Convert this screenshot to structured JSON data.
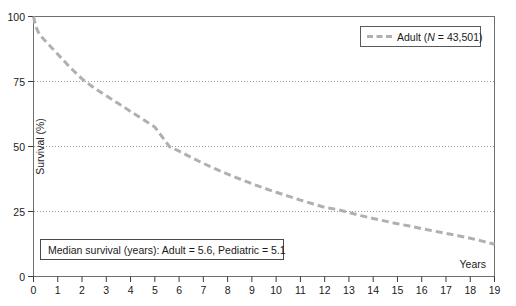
{
  "chart_data": {
    "type": "line",
    "title": "",
    "xlabel": "Years",
    "ylabel": "Survival (%)",
    "xlim": [
      0,
      19
    ],
    "ylim": [
      0,
      100
    ],
    "x_ticks": [
      0,
      1,
      2,
      3,
      4,
      5,
      6,
      7,
      8,
      9,
      10,
      11,
      12,
      13,
      14,
      15,
      16,
      17,
      18,
      19
    ],
    "y_ticks": [
      0,
      25,
      50,
      75,
      100
    ],
    "grid": "horizontal-dotted-at-25-50-75",
    "legend_position": "top-right",
    "series": [
      {
        "name": "Adult (N = 43,501)",
        "color": "#b0b0b0",
        "style": "dashed",
        "x": [
          0,
          0.1,
          0.25,
          0.5,
          0.75,
          1,
          1.25,
          1.5,
          2,
          2.5,
          3,
          3.5,
          4,
          4.5,
          5,
          5.6,
          6,
          6.5,
          7,
          7.5,
          8,
          8.5,
          9,
          9.5,
          10,
          10.5,
          11,
          11.5,
          12,
          12.5,
          13,
          13.5,
          14,
          14.5,
          15,
          15.5,
          16,
          16.5,
          17,
          17.5,
          18,
          18.5,
          19
        ],
        "y": [
          100,
          96,
          93,
          90.5,
          88,
          85.5,
          83,
          80.5,
          76,
          72.5,
          69.5,
          66.5,
          63.5,
          60.5,
          57.5,
          50,
          48.2,
          45.8,
          43.5,
          41.4,
          39.4,
          37.5,
          35.7,
          34,
          32.4,
          30.9,
          29.4,
          28,
          26.6,
          25.8,
          24.6,
          23.4,
          22.3,
          21.3,
          20.3,
          19.4,
          18.4,
          17.5,
          16.6,
          15.7,
          14.7,
          13.6,
          12.4
        ]
      }
    ],
    "annotations": [
      {
        "name": "median-survival-box",
        "text": "Median survival (years): Adult = 5.6, Pediatric = 5.1"
      }
    ]
  },
  "legend": {
    "entries": [
      {
        "label_plain": "Adult",
        "n_prefix": "N",
        "n_value": " = 43,501"
      }
    ]
  },
  "axes": {
    "x_title": "Years",
    "y_title": "Survival (%)"
  }
}
